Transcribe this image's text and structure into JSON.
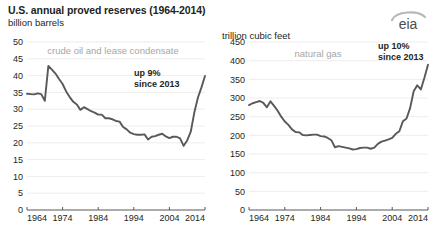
{
  "header": {
    "title": "U.S. annual proved reserves (1964-2014)",
    "logo_text": "eia",
    "logo_name": "eia-logo"
  },
  "charts": [
    {
      "id": "crude-oil",
      "units_label": "billion barrels",
      "series_label": "crude oil and lease condensate",
      "callout_line1": "up 9%",
      "callout_line2": "since 2013",
      "ylabels": [
        "0",
        "5",
        "10",
        "15",
        "20",
        "25",
        "30",
        "35",
        "40",
        "45",
        "50"
      ],
      "xlabels": [
        "1964",
        "1974",
        "1984",
        "1994",
        "2004",
        "2014"
      ]
    },
    {
      "id": "natural-gas",
      "units_label": "trillion cubic feet",
      "series_label": "natural gas",
      "callout_line1": "up 10%",
      "callout_line2": "since 2013",
      "ylabels": [
        "0",
        "50",
        "100",
        "150",
        "200",
        "250",
        "300",
        "350",
        "400",
        "450"
      ],
      "xlabels": [
        "1964",
        "1974",
        "1984",
        "1994",
        "2004",
        "2014"
      ]
    }
  ],
  "chart_data": [
    {
      "type": "line",
      "id": "crude-oil",
      "title": "U.S. annual proved reserves (1964-2014)",
      "subtitle": "crude oil and lease condensate",
      "xlabel": "",
      "ylabel": "billion barrels",
      "xlim": [
        1964,
        2014
      ],
      "ylim": [
        0,
        50
      ],
      "grid": true,
      "legend": "none",
      "annotations": [
        "up 9% since 2013"
      ],
      "x": [
        1964,
        1965,
        1966,
        1967,
        1968,
        1969,
        1970,
        1971,
        1972,
        1973,
        1974,
        1975,
        1976,
        1977,
        1978,
        1979,
        1980,
        1981,
        1982,
        1983,
        1984,
        1985,
        1986,
        1987,
        1988,
        1989,
        1990,
        1991,
        1992,
        1993,
        1994,
        1995,
        1996,
        1997,
        1998,
        1999,
        2000,
        2001,
        2002,
        2003,
        2004,
        2005,
        2006,
        2007,
        2008,
        2009,
        2010,
        2011,
        2012,
        2013,
        2014
      ],
      "y": [
        34.6,
        34.5,
        34.4,
        34.7,
        34.5,
        32.5,
        42.9,
        41.8,
        40.6,
        39.0,
        37.5,
        35.3,
        33.6,
        32.2,
        31.4,
        29.8,
        30.6,
        30.0,
        29.4,
        29.0,
        28.4,
        28.4,
        27.3,
        27.3,
        27.0,
        26.5,
        26.3,
        24.7,
        24.0,
        23.0,
        22.6,
        22.4,
        22.4,
        22.5,
        21.0,
        21.8,
        22.0,
        22.4,
        22.7,
        21.9,
        21.4,
        21.8,
        21.8,
        21.3,
        19.1,
        20.7,
        23.3,
        29.0,
        33.4,
        36.5,
        39.9
      ]
    },
    {
      "type": "line",
      "id": "natural-gas",
      "title": "U.S. annual proved reserves (1964-2014)",
      "subtitle": "natural gas",
      "xlabel": "",
      "ylabel": "trillion cubic feet",
      "xlim": [
        1964,
        2014
      ],
      "ylim": [
        0,
        450
      ],
      "grid": true,
      "legend": "none",
      "annotations": [
        "up 10% since 2013"
      ],
      "x": [
        1964,
        1965,
        1966,
        1967,
        1968,
        1969,
        1970,
        1971,
        1972,
        1973,
        1974,
        1975,
        1976,
        1977,
        1978,
        1979,
        1980,
        1981,
        1982,
        1983,
        1984,
        1985,
        1986,
        1987,
        1988,
        1989,
        1990,
        1991,
        1992,
        1993,
        1994,
        1995,
        1996,
        1997,
        1998,
        1999,
        2000,
        2001,
        2002,
        2003,
        2004,
        2005,
        2006,
        2007,
        2008,
        2009,
        2010,
        2011,
        2012,
        2013,
        2014
      ],
      "y": [
        281,
        286,
        289,
        292,
        287,
        275,
        291,
        279,
        266,
        250,
        237,
        228,
        216,
        209,
        208,
        201,
        200,
        201,
        202,
        202,
        198,
        197,
        193,
        187,
        168,
        171,
        169,
        167,
        165,
        162,
        163,
        166,
        167,
        167,
        164,
        167,
        177,
        183,
        186,
        189,
        193,
        204,
        211,
        238,
        245,
        273,
        318,
        334,
        323,
        354,
        389
      ]
    }
  ]
}
